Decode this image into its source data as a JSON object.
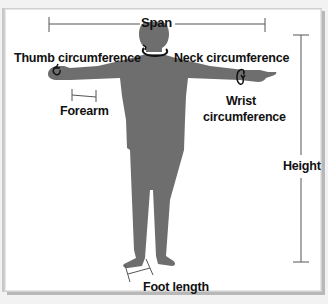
{
  "diagram": {
    "colors": {
      "figure": "#6e6e6e",
      "lines": "#555555",
      "text": "#111111",
      "background": "#ffffff",
      "frame": "#d0d0d0"
    },
    "labels": {
      "span": "Span",
      "thumb": "Thumb circumference",
      "neck": "Neck circumference",
      "forearm": "Forearm",
      "wrist_line1": "Wrist",
      "wrist_line2": "circumference",
      "height": "Height",
      "foot": "Foot length"
    }
  }
}
